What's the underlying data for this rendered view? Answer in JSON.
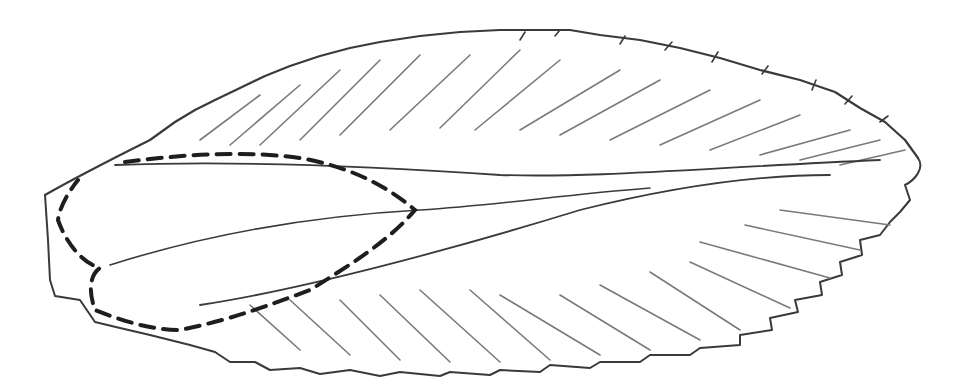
{
  "drawing": {
    "subject": "pencil sketch of a wing with feather-like serrated margin",
    "stroke_color": "#3a3a3a",
    "dash_color": "#1e1e1e",
    "background": "#ffffff"
  }
}
